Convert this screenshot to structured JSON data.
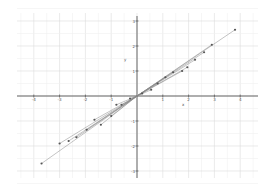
{
  "chart_data": {
    "type": "scatter",
    "title": "",
    "xlabel": "x",
    "ylabel": "y",
    "xlim": [
      -4.3,
      4.8
    ],
    "ylim": [
      -3.4,
      3.4
    ],
    "xticks": [
      -4,
      -3,
      -2,
      -1,
      1,
      2,
      3,
      4
    ],
    "yticks": [
      3,
      2,
      1,
      -1,
      -2,
      -3
    ],
    "grid": true,
    "points": [
      {
        "x": -3.7,
        "y": -2.7
      },
      {
        "x": -3.0,
        "y": -1.9
      },
      {
        "x": -2.65,
        "y": -1.8
      },
      {
        "x": -2.35,
        "y": -1.65
      },
      {
        "x": -1.95,
        "y": -1.35
      },
      {
        "x": -1.65,
        "y": -0.95
      },
      {
        "x": -1.4,
        "y": -1.15
      },
      {
        "x": -1.0,
        "y": -0.8
      },
      {
        "x": -0.8,
        "y": -0.35
      },
      {
        "x": -0.6,
        "y": -0.35
      },
      {
        "x": -0.27,
        "y": -0.1
      },
      {
        "x": 0.2,
        "y": 0.1
      },
      {
        "x": 0.55,
        "y": 0.25
      },
      {
        "x": 0.8,
        "y": 0.5
      },
      {
        "x": 1.1,
        "y": 0.75
      },
      {
        "x": 1.4,
        "y": 0.95
      },
      {
        "x": 1.75,
        "y": 1.0
      },
      {
        "x": 1.95,
        "y": 1.15
      },
      {
        "x": 2.25,
        "y": 1.45
      },
      {
        "x": 2.6,
        "y": 1.75
      },
      {
        "x": 2.9,
        "y": 2.05
      },
      {
        "x": 3.8,
        "y": 2.65
      }
    ],
    "segments_through_origin": true,
    "colors": {
      "grid": "#e6e6e6",
      "axis": "#444444",
      "line": "#888888",
      "point": "#555555"
    }
  }
}
